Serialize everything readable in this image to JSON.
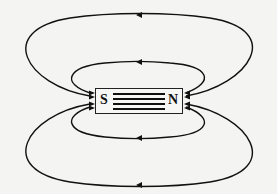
{
  "diagram": {
    "type": "magnetic-field-lines-bar-magnet",
    "magnet": {
      "south_label": "S",
      "north_label": "N",
      "internal_lines": 4
    },
    "field_loops": [
      {
        "position": "top-outer",
        "arrow_direction": "left"
      },
      {
        "position": "top-inner",
        "arrow_direction": "left"
      },
      {
        "position": "bottom-inner",
        "arrow_direction": "left"
      },
      {
        "position": "bottom-outer",
        "arrow_direction": "left"
      }
    ],
    "colors": {
      "line": "#111111",
      "background": "#f4f4f2"
    }
  }
}
